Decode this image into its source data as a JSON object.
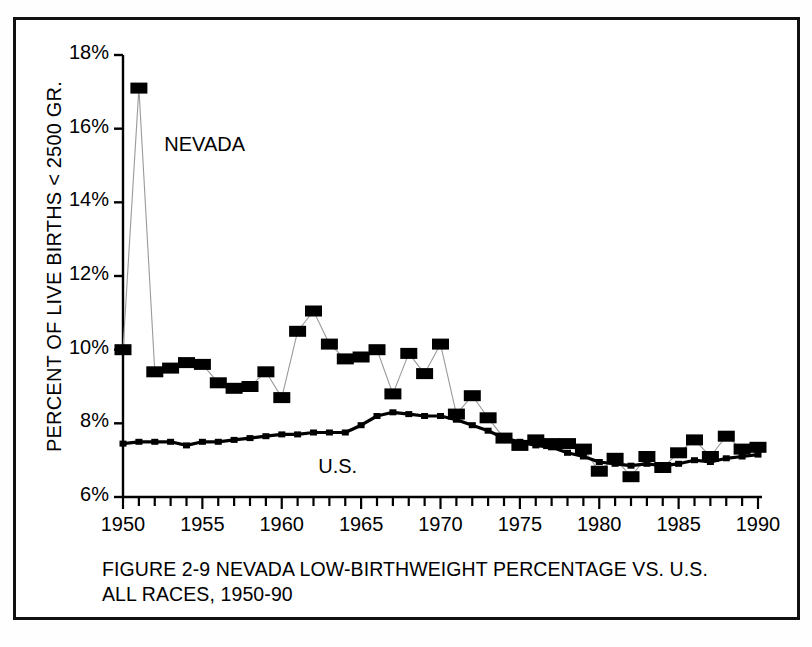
{
  "figure": {
    "caption_line1": "FIGURE 2-9  NEVADA LOW-BIRTHWEIGHT PERCENTAGE VS. U.S.",
    "caption_line2": "ALL RACES, 1950-90",
    "y_axis_title": "PERCENT OF LIVE BIRTHS < 2500  GR.",
    "series_label_nevada": "NEVADA",
    "series_label_us": "U.S.",
    "border_color": "#111111",
    "background_color": "#ffffff",
    "ink_color": "#000000"
  },
  "chart_data": {
    "type": "line",
    "title": "FIGURE 2-9  NEVADA LOW-BIRTHWEIGHT PERCENTAGE VS. U.S. ALL RACES, 1950-90",
    "xlabel": "",
    "ylabel": "PERCENT OF LIVE BIRTHS < 2500  GR.",
    "xlim": [
      1950,
      1990
    ],
    "ylim": [
      6,
      18
    ],
    "ytick_labels": [
      "18%",
      "16%",
      "14%",
      "12%",
      "10%",
      "8%",
      "6%"
    ],
    "ytick_values": [
      18,
      16,
      14,
      12,
      10,
      8,
      6
    ],
    "xtick_labels": [
      "1950",
      "1955",
      "1960",
      "1965",
      "1970",
      "1975",
      "1980",
      "1985",
      "1990"
    ],
    "xtick_values": [
      1950,
      1955,
      1960,
      1965,
      1970,
      1975,
      1980,
      1985,
      1990
    ],
    "minor_xtick_interval": 1,
    "grid": false,
    "legend": "inline-annotation",
    "x": [
      1950,
      1951,
      1952,
      1953,
      1954,
      1955,
      1956,
      1957,
      1958,
      1959,
      1960,
      1961,
      1962,
      1963,
      1964,
      1965,
      1966,
      1967,
      1968,
      1969,
      1970,
      1971,
      1972,
      1973,
      1974,
      1975,
      1976,
      1977,
      1978,
      1979,
      1980,
      1981,
      1982,
      1983,
      1984,
      1985,
      1986,
      1987,
      1988,
      1989,
      1990
    ],
    "series": [
      {
        "name": "NEVADA",
        "marker": "large-filled-square",
        "line_weight": "thin",
        "values": [
          10.0,
          17.1,
          9.4,
          9.5,
          9.65,
          9.6,
          9.1,
          8.95,
          9.0,
          9.4,
          8.7,
          10.5,
          11.05,
          10.15,
          9.75,
          9.8,
          10.0,
          8.8,
          9.9,
          9.35,
          10.15,
          8.25,
          8.75,
          8.15,
          7.6,
          7.4,
          7.55,
          7.45,
          7.45,
          7.3,
          6.7,
          7.05,
          6.55,
          7.1,
          6.8,
          7.2,
          7.55,
          7.1,
          7.65,
          7.3,
          7.35
        ]
      },
      {
        "name": "U.S.",
        "marker": "small-filled-square",
        "line_weight": "thick",
        "values": [
          7.45,
          7.5,
          7.5,
          7.5,
          7.4,
          7.5,
          7.5,
          7.55,
          7.6,
          7.65,
          7.7,
          7.7,
          7.75,
          7.75,
          7.75,
          7.95,
          8.2,
          8.3,
          8.25,
          8.2,
          8.2,
          8.1,
          7.95,
          7.8,
          7.6,
          7.5,
          7.4,
          7.35,
          7.2,
          7.1,
          6.95,
          6.9,
          6.85,
          6.9,
          6.85,
          6.9,
          7.0,
          6.95,
          7.05,
          7.1,
          7.15
        ]
      }
    ],
    "annotations": [
      {
        "text": "NEVADA",
        "x": 1952.6,
        "y": 15.5
      },
      {
        "text": "U.S.",
        "x": 1962.3,
        "y": 6.75
      }
    ]
  }
}
